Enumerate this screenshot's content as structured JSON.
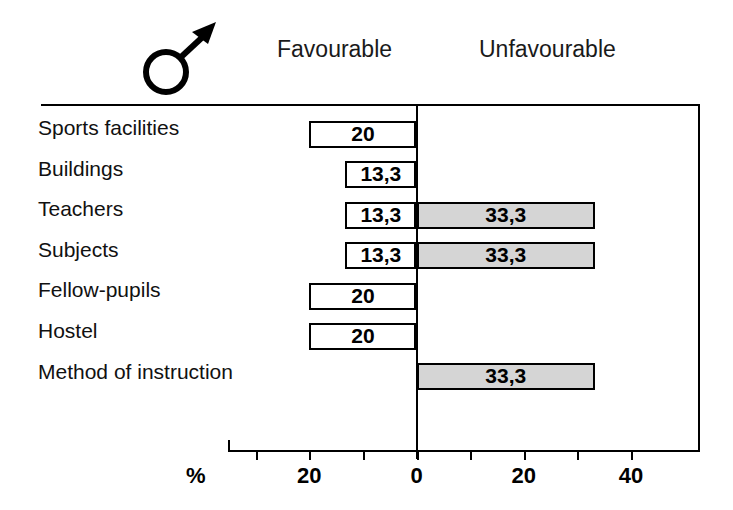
{
  "header": {
    "gender_icon": "male-symbol-icon",
    "favourable_label": "Favourable",
    "unfavourable_label": "Unfavourable"
  },
  "axis": {
    "unit_label": "%",
    "tick_labels": [
      "20",
      "0",
      "20",
      "40"
    ],
    "tick_values": [
      -20,
      0,
      20,
      40
    ],
    "minor_tick_values": [
      -30,
      -10,
      10,
      30
    ]
  },
  "colors": {
    "favourable_fill": "#ffffff",
    "unfavourable_fill": "#d5d5d5",
    "outline": "#000000"
  },
  "chart_data": {
    "type": "bar",
    "orientation": "horizontal",
    "style": "diverging",
    "title": "",
    "subtitle": "",
    "xlabel": "%",
    "ylabel": "",
    "xlim": [
      -35,
      50
    ],
    "grid": false,
    "legend_position": "top",
    "categories": [
      "Sports facilities",
      "Buildings",
      "Teachers",
      "Subjects",
      "Fellow-pupils",
      "Hostel",
      "Method of instruction"
    ],
    "series": [
      {
        "name": "Favourable",
        "direction": "left",
        "values": [
          20,
          13.3,
          13.3,
          13.3,
          20,
          20,
          0
        ],
        "labels": [
          "20",
          "13,3",
          "13,3",
          "13,3",
          "20",
          "20",
          ""
        ]
      },
      {
        "name": "Unfavourable",
        "direction": "right",
        "values": [
          0,
          0,
          33.3,
          33.3,
          0,
          0,
          33.3
        ],
        "labels": [
          "",
          "",
          "33,3",
          "33,3",
          "",
          "",
          "33,3"
        ]
      }
    ]
  }
}
